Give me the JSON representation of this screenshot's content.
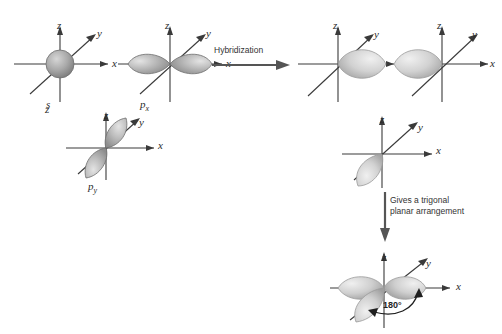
{
  "figure": {
    "background_color": "#ffffff",
    "axis_color": "#3a3a3a",
    "lobe_fill_light": "#e8e8e8",
    "lobe_fill_mid": "#b8b8b8",
    "lobe_fill_dark": "#8a8a8a",
    "lobe_stroke": "#6e6e6e",
    "text_color": "#2b2b2b"
  },
  "axis_labels": {
    "x": "x",
    "y": "y",
    "z": "z"
  },
  "inputs": [
    {
      "id": "s-orbital",
      "label": "s",
      "label_plain": "s",
      "subscript": "",
      "shape": "sphere",
      "description": "spherical s atomic orbital centered at origin"
    },
    {
      "id": "px-orbital",
      "label": "p",
      "label_plain": "px",
      "subscript": "x",
      "shape": "dumbbell-x",
      "description": "two-lobed p orbital aligned along the x axis"
    },
    {
      "id": "py-orbital",
      "label": "p",
      "label_plain": "py",
      "subscript": "y",
      "shape": "dumbbell-y",
      "description": "two-lobed p orbital aligned along the y axis"
    }
  ],
  "steps": [
    {
      "id": "hybridization-step",
      "text": "Hybridization",
      "direction": "right"
    },
    {
      "id": "trigonal-step",
      "text": "Gives a trigonal\nplanar arrangement",
      "direction": "down"
    }
  ],
  "outputs": [
    {
      "id": "hybrid-orbital-1",
      "shape": "single-lobe",
      "points_toward": "+x",
      "description": "hybrid orbital lobe pointing along positive x"
    },
    {
      "id": "hybrid-orbital-2",
      "shape": "single-lobe",
      "points_toward": "-x",
      "description": "hybrid orbital lobe pointing along negative x"
    },
    {
      "id": "hybrid-orbital-3",
      "shape": "single-lobe",
      "points_toward": "-y",
      "description": "hybrid orbital lobe pointing along negative y"
    }
  ],
  "result": {
    "id": "trigonal-planar-result",
    "angle_label": "180°",
    "lobe_count": 3,
    "description": "three hybrid orbitals in a trigonal planar arrangement"
  }
}
